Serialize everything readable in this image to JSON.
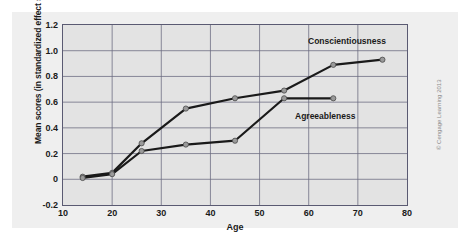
{
  "figure": {
    "credit": "© Cengage Learning 2013"
  },
  "chart_data": {
    "type": "line",
    "title": "",
    "xlabel": "Age",
    "ylabel": "Mean scores (in standardized effect sizes)",
    "xlim": [
      10,
      80
    ],
    "ylim": [
      -0.2,
      1.2
    ],
    "xticks": [
      10,
      20,
      30,
      40,
      50,
      60,
      70,
      80
    ],
    "xtick_labels": [
      "10",
      "20",
      "30",
      "40",
      "50",
      "60",
      "70",
      "80"
    ],
    "yticks": [
      -0.2,
      0,
      0.2,
      0.4,
      0.6,
      0.8,
      1.0,
      1.2
    ],
    "ytick_labels": [
      "-0.2",
      "0",
      "0.2",
      "0.4",
      "0.6",
      "0.8",
      "1.0",
      "1.2"
    ],
    "grid": true,
    "grid_color": "#6b6b80",
    "plot_bgcolor": "#e3e3e3",
    "legend_position": "inline-annotations",
    "line_color": "#1a1a1a",
    "marker_color": "#9a9a9a",
    "series": [
      {
        "name": "Conscientiousness",
        "label_x": 65,
        "label_y": 1.04,
        "x": [
          14,
          20,
          26,
          35,
          45,
          55,
          65,
          75
        ],
        "y": [
          0.02,
          0.05,
          0.28,
          0.55,
          0.63,
          0.69,
          0.89,
          0.93
        ]
      },
      {
        "name": "Agreeableness",
        "label_x": 56,
        "label_y": 0.48,
        "x": [
          14,
          20,
          26,
          35,
          45,
          55,
          65
        ],
        "y": [
          0.01,
          0.04,
          0.22,
          0.27,
          0.3,
          0.63,
          0.63
        ]
      }
    ]
  }
}
